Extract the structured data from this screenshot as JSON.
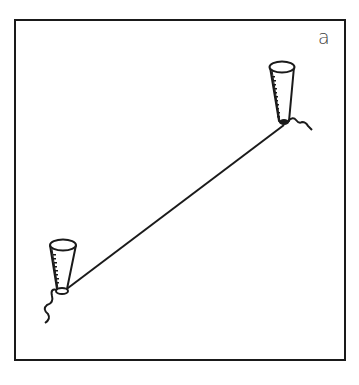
{
  "figure": {
    "panel_label": "a",
    "colors": {
      "ink": "#1a1a1a",
      "background": "#ffffff"
    },
    "elements": {
      "frame": "rectangular border",
      "cup_upper": "conical cup with dotted/graduated side shading, string knot at base",
      "cup_lower": "conical cup with dotted/graduated side shading, string knot at base",
      "string": "straight line connecting the two cups"
    }
  }
}
